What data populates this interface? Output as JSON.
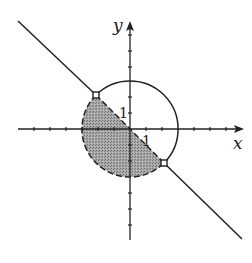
{
  "diagram": {
    "type": "region-graph",
    "axes": {
      "x_label": "x",
      "y_label": "y",
      "x_tick_label": "1",
      "y_tick_label": "1",
      "x_ticks": [
        -6,
        -5,
        -4,
        -3,
        -2,
        -1,
        1,
        2,
        3,
        4,
        5,
        6,
        7
      ],
      "y_ticks": [
        -7,
        -6,
        -5,
        -4,
        -3,
        -2,
        -1,
        1,
        2,
        3,
        4,
        5,
        6
      ]
    },
    "circle": {
      "center": [
        0,
        0
      ],
      "radius": 3,
      "upper_arc_style": "solid",
      "lower_arc_style": "dashed"
    },
    "line": {
      "equation": "y = -x",
      "style": "solid",
      "inside_circle_style": "dashed"
    },
    "open_points": [
      {
        "x": -2.12,
        "y": 2.12
      },
      {
        "x": 2.12,
        "y": -2.12
      }
    ],
    "shaded_region": {
      "inequality": "x^2 + y^2 < 9 and y < -x",
      "fill": "#9a9a9a"
    },
    "colors": {
      "stroke": "#222222",
      "shade": "#9a9a9a",
      "background": "#ffffff"
    }
  }
}
